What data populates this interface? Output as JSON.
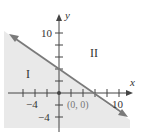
{
  "diagram": {
    "type": "inequality-graph",
    "axes": {
      "x_label": "x",
      "y_label": "y",
      "x_tick_labels": [
        "−4",
        "10"
      ],
      "y_tick_labels": [
        "10",
        "−4"
      ]
    },
    "origin_label": "(0, 0)",
    "regions": {
      "shaded_label": "I",
      "unshaded_label": "II"
    },
    "colors": {
      "shading": "#e9e9e9",
      "line": "#7a7a7a",
      "axis": "#444444"
    }
  }
}
